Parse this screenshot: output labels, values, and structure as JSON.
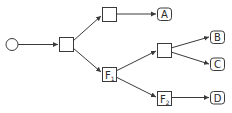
{
  "diagram": {
    "type": "decision-tree",
    "colors": {
      "stroke": "#3a3a3a",
      "fill": "#ffffff",
      "text": "#2a2a2a"
    },
    "nodes": [
      {
        "id": "root",
        "shape": "circle",
        "label": ""
      },
      {
        "id": "n1",
        "shape": "square",
        "label": ""
      },
      {
        "id": "n2",
        "shape": "square",
        "label": ""
      },
      {
        "id": "f1",
        "shape": "square",
        "label": "F",
        "subscript": "1"
      },
      {
        "id": "n3",
        "shape": "square",
        "label": ""
      },
      {
        "id": "f2",
        "shape": "square",
        "label": "F",
        "subscript": "2"
      },
      {
        "id": "a",
        "shape": "rounded",
        "label": "A"
      },
      {
        "id": "b",
        "shape": "rounded",
        "label": "B"
      },
      {
        "id": "c",
        "shape": "rounded",
        "label": "C"
      },
      {
        "id": "d",
        "shape": "rounded",
        "label": "D"
      }
    ],
    "edges": [
      [
        "root",
        "n1"
      ],
      [
        "n1",
        "n2"
      ],
      [
        "n1",
        "f1"
      ],
      [
        "n2",
        "a"
      ],
      [
        "f1",
        "n3"
      ],
      [
        "f1",
        "f2"
      ],
      [
        "n3",
        "b"
      ],
      [
        "n3",
        "c"
      ],
      [
        "f2",
        "d"
      ]
    ]
  }
}
